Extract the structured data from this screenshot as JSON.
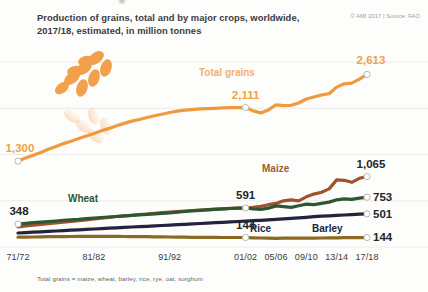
{
  "header": {
    "title_line1": "Production of grains, total and by major crops, worldwide,",
    "title_line2": "2017/18, estimated, in million tonnes",
    "credit": "© AMI 2017 | Source: FAO"
  },
  "footnote": "Total grains = maize, wheat, barley, rice, rye, oat, sorghum",
  "icon": {
    "name": "wheat-ear-icon"
  },
  "colors": {
    "total_grains": "#ef9a3d",
    "maize": "#a0522d",
    "wheat": "#2d5733",
    "rice": "#23233f",
    "barley": "#8a6a22",
    "grid": "#ececea",
    "text": "#3b3b3b",
    "credit": "#9a9a96"
  },
  "chart_data": {
    "type": "line",
    "title": "Production of grains, total and by major crops, worldwide, 2017/18, estimated, in million tonnes",
    "xlabel": "",
    "ylabel": "million tonnes",
    "grid": true,
    "legend": "inline-labels",
    "xticklabels": [
      "71/72",
      "81/82",
      "91/92",
      "01/02",
      "05/06",
      "09/10",
      "13/14",
      "17/18"
    ],
    "xtick_positions": [
      0,
      10,
      20,
      30,
      34,
      38,
      42,
      46
    ],
    "xlim": [
      0,
      46
    ],
    "ylim": [
      0,
      2800
    ],
    "endpoint_labels": {
      "total_grains_start": "1,300",
      "total_grains_mid": "2,111",
      "total_grains_end": "2,613",
      "wheat_start": "348",
      "wheat_mid": "591",
      "wheat_end": "753",
      "maize_end": "1,065",
      "rice_end": "501",
      "barley_mid": "144",
      "barley_end": "144"
    },
    "series": [
      {
        "name": "Total grains",
        "color": "#ef9a3d",
        "label_x": 199,
        "label_y": 32,
        "values": [
          1300,
          1345,
          1390,
          1430,
          1480,
          1520,
          1565,
          1600,
          1640,
          1680,
          1720,
          1760,
          1795,
          1835,
          1870,
          1905,
          1930,
          1960,
          1985,
          2010,
          2035,
          2055,
          2070,
          2080,
          2090,
          2095,
          2100,
          2105,
          2108,
          2110,
          2111,
          2060,
          2030,
          2075,
          2150,
          2140,
          2145,
          2180,
          2240,
          2270,
          2300,
          2320,
          2420,
          2470,
          2480,
          2540,
          2613
        ]
      },
      {
        "name": "Maize",
        "color": "#a0522d",
        "label_x": 262,
        "label_y": 128,
        "values": [
          305,
          318,
          330,
          342,
          352,
          363,
          375,
          388,
          400,
          412,
          425,
          438,
          450,
          462,
          470,
          480,
          492,
          500,
          510,
          520,
          528,
          536,
          545,
          552,
          560,
          566,
          572,
          578,
          584,
          588,
          591,
          600,
          615,
          640,
          660,
          700,
          715,
          700,
          760,
          800,
          830,
          880,
          1015,
          1010,
          980,
          1040,
          1065
        ]
      },
      {
        "name": "Wheat",
        "color": "#2d5733",
        "label_x": 68,
        "label_y": 158,
        "values": [
          348,
          358,
          368,
          376,
          385,
          394,
          402,
          410,
          418,
          428,
          437,
          446,
          454,
          462,
          470,
          478,
          486,
          494,
          502,
          510,
          518,
          528,
          537,
          546,
          554,
          562,
          570,
          576,
          582,
          587,
          591,
          575,
          568,
          588,
          622,
          610,
          600,
          625,
          650,
          640,
          660,
          680,
          715,
          730,
          720,
          740,
          753
        ]
      },
      {
        "name": "Rice",
        "color": "#23233f",
        "label_x": 250,
        "label_y": 188,
        "values": [
          212,
          218,
          224,
          230,
          236,
          242,
          248,
          254,
          260,
          266,
          272,
          278,
          284,
          290,
          296,
          302,
          308,
          314,
          320,
          326,
          332,
          338,
          344,
          350,
          356,
          362,
          368,
          374,
          380,
          386,
          392,
          398,
          404,
          410,
          418,
          426,
          434,
          442,
          450,
          458,
          466,
          472,
          478,
          484,
          490,
          496,
          501
        ]
      },
      {
        "name": "Barley",
        "color": "#8a6a22",
        "label_x": 312,
        "label_y": 188,
        "values": [
          148,
          150,
          152,
          154,
          156,
          157,
          158,
          159,
          160,
          161,
          162,
          162,
          161,
          160,
          159,
          158,
          157,
          156,
          155,
          153,
          151,
          149,
          148,
          147,
          146,
          145,
          145,
          144,
          144,
          144,
          144,
          140,
          136,
          134,
          132,
          133,
          135,
          134,
          133,
          134,
          136,
          138,
          140,
          141,
          142,
          143,
          144
        ]
      }
    ]
  }
}
